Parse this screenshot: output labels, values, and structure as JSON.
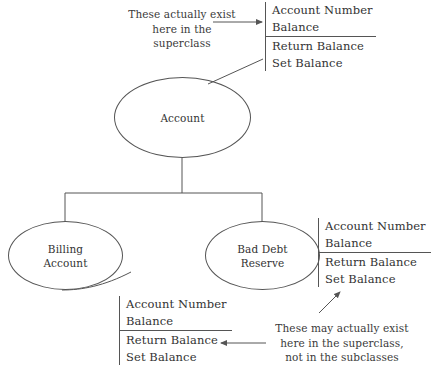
{
  "diagram": {
    "type": "uml-generalization",
    "background_color": "#ffffff",
    "line_color": "#555555",
    "text_color": "#333333"
  },
  "nodes": {
    "superclass": {
      "label": "Account"
    },
    "subclass_left": {
      "label": "Billing\nAccount"
    },
    "subclass_right": {
      "label": "Bad Debt\nReserve"
    }
  },
  "blocks": {
    "top": {
      "attributes": [
        "Account Number",
        "Balance"
      ],
      "operations": [
        "Return Balance",
        "Set Balance"
      ]
    },
    "right": {
      "attributes": [
        "Account Number",
        "Balance"
      ],
      "operations": [
        "Return Balance",
        "Set Balance"
      ]
    },
    "bottom": {
      "attributes": [
        "Account Number",
        "Balance"
      ],
      "operations": [
        "Return Balance",
        "Set Balance"
      ]
    }
  },
  "annotations": {
    "top": {
      "lines": [
        "These actually exist",
        "here in the",
        "superclass"
      ]
    },
    "bottom": {
      "lines": [
        "These may actually exist",
        "here in the superclass,",
        "not in the subclasses"
      ]
    }
  }
}
